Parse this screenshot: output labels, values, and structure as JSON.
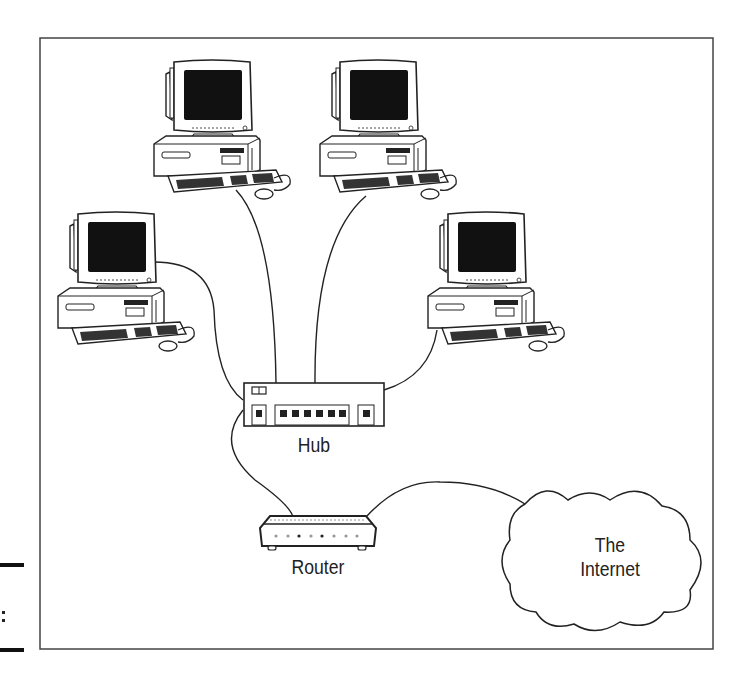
{
  "diagram": {
    "type": "network-topology",
    "frame": {
      "x": 40,
      "y": 38,
      "width": 673,
      "height": 611,
      "stroke": "#444444"
    },
    "nodes": [
      {
        "id": "pc1",
        "kind": "desktop-computer",
        "label": "",
        "x": 150,
        "y": 58
      },
      {
        "id": "pc2",
        "kind": "desktop-computer",
        "label": "",
        "x": 318,
        "y": 58
      },
      {
        "id": "pc3",
        "kind": "desktop-computer",
        "label": "",
        "x": 56,
        "y": 210
      },
      {
        "id": "pc4",
        "kind": "desktop-computer",
        "label": "",
        "x": 426,
        "y": 210
      },
      {
        "id": "hub",
        "kind": "hub",
        "label": "Hub",
        "ports": 8
      },
      {
        "id": "router",
        "kind": "router",
        "label": "Router",
        "indicator_lights": 8
      },
      {
        "id": "internet",
        "kind": "cloud",
        "label_line1": "The",
        "label_line2": "Internet"
      }
    ],
    "edges": [
      {
        "from": "pc1",
        "to": "hub"
      },
      {
        "from": "pc2",
        "to": "hub"
      },
      {
        "from": "pc3",
        "to": "hub"
      },
      {
        "from": "pc4",
        "to": "hub"
      },
      {
        "from": "hub",
        "to": "router"
      },
      {
        "from": "router",
        "to": "internet"
      }
    ]
  },
  "labels": {
    "hub": "Hub",
    "router": "Router",
    "internet_line1": "The",
    "internet_line2": "Internet"
  },
  "colors": {
    "line": "#222222",
    "screen": "#111111",
    "background": "#ffffff"
  }
}
